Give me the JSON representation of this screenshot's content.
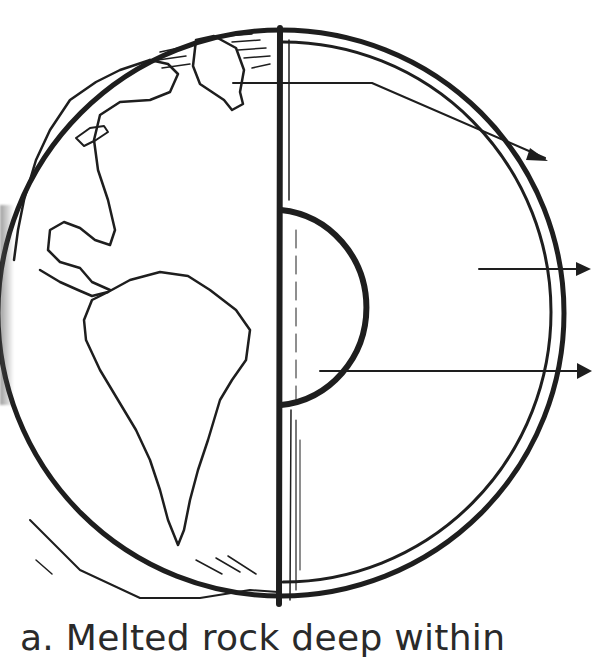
{
  "diagram": {
    "colors": {
      "ink": "#1e1e1e",
      "background": "#ffffff"
    },
    "layers": [
      {
        "id": "crust",
        "arrow_label": ""
      },
      {
        "id": "mantle",
        "arrow_label": ""
      },
      {
        "id": "outer-core",
        "arrow_label": ""
      }
    ],
    "arrows_count": 3
  },
  "caption": {
    "text": "a. Melted rock deep within"
  }
}
